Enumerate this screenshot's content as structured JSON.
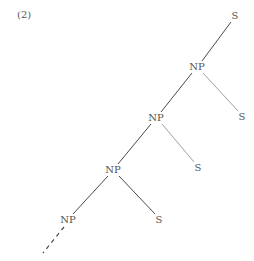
{
  "example_number": "(2)",
  "nodes": [
    {
      "id": "s0",
      "label": "S",
      "x": 235,
      "y": 16
    },
    {
      "id": "np1",
      "label": "NP",
      "x": 197,
      "y": 67
    },
    {
      "id": "s1",
      "label": "S",
      "x": 242,
      "y": 117
    },
    {
      "id": "np2",
      "label": "NP",
      "x": 156,
      "y": 118
    },
    {
      "id": "s2",
      "label": "S",
      "x": 198,
      "y": 168
    },
    {
      "id": "np3",
      "label": "NP",
      "x": 113,
      "y": 170
    },
    {
      "id": "s3",
      "label": "S",
      "x": 159,
      "y": 220
    },
    {
      "id": "np4",
      "label": "NP",
      "x": 68,
      "y": 220
    }
  ],
  "edges": [
    {
      "from": "s0",
      "to": "np1",
      "style": "solid"
    },
    {
      "from": "np1",
      "to": "s1",
      "style": "faint"
    },
    {
      "from": "np1",
      "to": "np2",
      "style": "solid"
    },
    {
      "from": "np2",
      "to": "s2",
      "style": "faint"
    },
    {
      "from": "np2",
      "to": "np3",
      "style": "solid"
    },
    {
      "from": "np3",
      "to": "s3",
      "style": "solid"
    },
    {
      "from": "np3",
      "to": "np4",
      "style": "solid"
    },
    {
      "from": "np4",
      "to": "continuation",
      "style": "dashed"
    }
  ],
  "colors": {
    "line": "#4a4a4a",
    "faint": "#9a9a9a",
    "text": "#555555"
  }
}
